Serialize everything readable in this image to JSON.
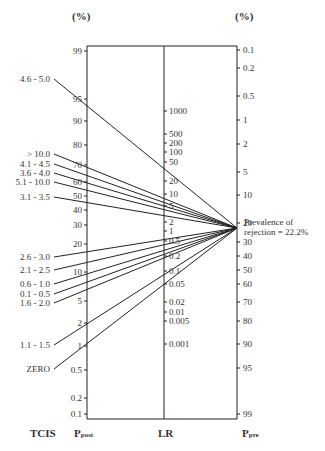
{
  "chart_data": {
    "type": "nomogram",
    "title": "",
    "units": {
      "left": "(%)",
      "right": "(%)"
    },
    "axes": {
      "left": {
        "name": "Ppost",
        "ticks": [
          {
            "v": "99",
            "y": 51
          },
          {
            "v": "95",
            "y": 99
          },
          {
            "v": "90",
            "y": 121
          },
          {
            "v": "80",
            "y": 145
          },
          {
            "v": "70",
            "y": 165
          },
          {
            "v": "60",
            "y": 182
          },
          {
            "v": "50",
            "y": 196
          },
          {
            "v": "40",
            "y": 210
          },
          {
            "v": "30",
            "y": 225
          },
          {
            "v": "20",
            "y": 244
          },
          {
            "v": "10",
            "y": 272
          },
          {
            "v": "5",
            "y": 301
          },
          {
            "v": "2",
            "y": 323
          },
          {
            "v": "1",
            "y": 346
          },
          {
            "v": "0.5",
            "y": 370
          },
          {
            "v": "0.2",
            "y": 398
          },
          {
            "v": "0.1",
            "y": 414
          }
        ]
      },
      "middle": {
        "name": "LR",
        "ticks": [
          {
            "v": "1000",
            "y": 111
          },
          {
            "v": "500",
            "y": 134
          },
          {
            "v": "200",
            "y": 143
          },
          {
            "v": "100",
            "y": 152
          },
          {
            "v": "50",
            "y": 162
          },
          {
            "v": "20",
            "y": 181
          },
          {
            "v": "10",
            "y": 194
          },
          {
            "v": "5",
            "y": 206
          },
          {
            "v": "2",
            "y": 222
          },
          {
            "v": "1",
            "y": 231
          },
          {
            "v": "0.5",
            "y": 241
          },
          {
            "v": "0.2",
            "y": 256
          },
          {
            "v": "0.1",
            "y": 271
          },
          {
            "v": "0.05",
            "y": 284
          },
          {
            "v": "0.02",
            "y": 302
          },
          {
            "v": "0.01",
            "y": 312
          },
          {
            "v": "0.005",
            "y": 321
          },
          {
            "v": "0.001",
            "y": 344
          }
        ]
      },
      "right": {
        "name": "Ppre",
        "ticks": [
          {
            "v": "0.1",
            "y": 50
          },
          {
            "v": "0.2",
            "y": 68
          },
          {
            "v": "0.5",
            "y": 96
          },
          {
            "v": "1",
            "y": 120
          },
          {
            "v": "2",
            "y": 144
          },
          {
            "v": "5",
            "y": 172
          },
          {
            "v": "10",
            "y": 195
          },
          {
            "v": "20",
            "y": 223
          },
          {
            "v": "30",
            "y": 242
          },
          {
            "v": "40",
            "y": 256
          },
          {
            "v": "50",
            "y": 270
          },
          {
            "v": "60",
            "y": 284
          },
          {
            "v": "70",
            "y": 302
          },
          {
            "v": "80",
            "y": 321
          },
          {
            "v": "90",
            "y": 344
          },
          {
            "v": "95",
            "y": 368
          },
          {
            "v": "99",
            "y": 414
          }
        ]
      }
    },
    "tcis_groups": [
      {
        "label": "4.6 - 5.0",
        "ly": 79
      },
      {
        "label": "> 10.0",
        "ly": 154
      },
      {
        "label": "4.1 - 4.5",
        "ly": 164
      },
      {
        "label": "3.6 - 4.0",
        "ly": 173
      },
      {
        "label": "5.1 - 10.0",
        "ly": 182
      },
      {
        "label": "3.1 - 3.5",
        "ly": 197
      },
      {
        "label": "2.6 - 3.0",
        "ly": 257
      },
      {
        "label": "2.1 - 2.5",
        "ly": 270
      },
      {
        "label": "0.6 - 1.0",
        "ly": 284
      },
      {
        "label": "0.1 - 0.5",
        "ly": 294
      },
      {
        "label": "1.6 - 2.0",
        "ly": 303
      },
      {
        "label": "1.1 - 1.5",
        "ly": 345
      },
      {
        "label": "ZERO",
        "ly": 369
      }
    ],
    "prevalence": {
      "value": "22.2%",
      "label_line1": "Prevalence of",
      "label_line2": "rejection = 22.2%"
    },
    "footer_labels": {
      "tcis": "TCIS",
      "ppost": "P",
      "ppost_sub": "post",
      "lr": "LR",
      "ppre": "P",
      "ppre_sub": "pre"
    }
  }
}
